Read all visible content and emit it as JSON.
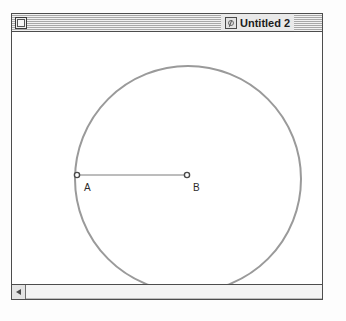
{
  "window": {
    "title": "Untitled 2",
    "title_icon": "sketch-document-icon",
    "close_box": "close-box",
    "frame_color": "#4d4d4d",
    "titlebar_pattern": "horizontal-pinstripe"
  },
  "scrollbar": {
    "left_arrow_icon": "triangle-left-icon",
    "orientation": "horizontal"
  },
  "sketch": {
    "background": "#ffffff",
    "stroke_color": "#9a9a9a",
    "point_color": "#6b6b6b",
    "label_color": "#2b2b2b",
    "circle": {
      "name": "construction-circle",
      "cx": 177,
      "cy": 165,
      "r": 113,
      "stroke_width": 2
    },
    "segment": {
      "name": "radius-segment",
      "x1": 66,
      "y1": 161,
      "x2": 176,
      "y2": 161,
      "stroke_width": 1
    },
    "points": [
      {
        "id": "A",
        "label": "A",
        "x": 66,
        "y": 161,
        "label_x": 73,
        "label_y": 177,
        "role": "on-circle"
      },
      {
        "id": "B",
        "label": "B",
        "x": 176,
        "y": 161,
        "label_x": 182,
        "label_y": 177,
        "role": "center"
      }
    ]
  }
}
